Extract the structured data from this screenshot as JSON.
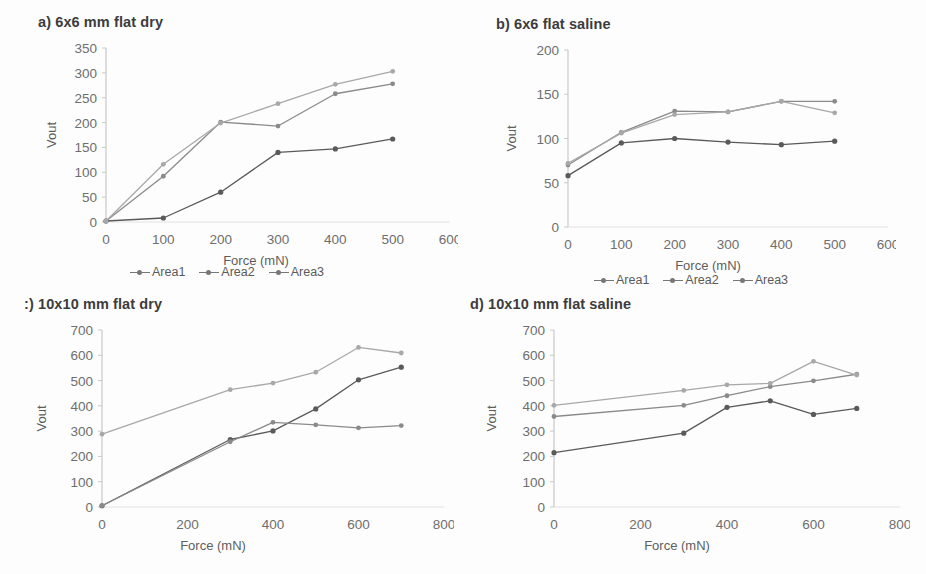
{
  "figure": {
    "background": "#fdfdfd",
    "series_colors": [
      "#5a5a5a",
      "#8a8a8a",
      "#a8a8a8"
    ],
    "legend_labels": [
      "Area1",
      "Area2",
      "Area3"
    ]
  },
  "panels": [
    {
      "id": "panel-a",
      "title": "a) 6x6 mm flat dry",
      "legend": [
        "Area1",
        "Area2",
        "Area3"
      ]
    },
    {
      "id": "panel-b",
      "title": "b) 6x6 flat saline",
      "legend": [
        "Area1",
        "Area2",
        "Area3"
      ]
    },
    {
      "id": "panel-c",
      "title": ":) 10x10 mm flat dry",
      "legend": []
    },
    {
      "id": "panel-d",
      "title": "d) 10x10 mm flat saline",
      "legend": []
    }
  ],
  "chart_data": [
    {
      "id": "a",
      "type": "line",
      "title": "a) 6x6 mm flat dry",
      "xlabel": "Force  (mN)",
      "ylabel": "Vout",
      "x": [
        0,
        100,
        200,
        300,
        400,
        500
      ],
      "xlim": [
        0,
        600
      ],
      "ylim": [
        0,
        350
      ],
      "xticks": [
        0,
        100,
        200,
        300,
        400,
        500,
        600
      ],
      "yticks": [
        0,
        50,
        100,
        150,
        200,
        250,
        300,
        350
      ],
      "grid": false,
      "legend_position": "bottom",
      "series": [
        {
          "name": "Area1",
          "values": [
            2,
            8,
            60,
            140,
            147,
            167
          ]
        },
        {
          "name": "Area2",
          "values": [
            2,
            92,
            201,
            193,
            258,
            278
          ]
        },
        {
          "name": "Area3",
          "values": [
            2,
            116,
            199,
            238,
            277,
            303
          ]
        }
      ]
    },
    {
      "id": "b",
      "type": "line",
      "title": "b) 6x6 flat saline",
      "xlabel": "Force (mN)",
      "ylabel": "Vout",
      "x": [
        0,
        100,
        200,
        300,
        400,
        500
      ],
      "xlim": [
        0,
        600
      ],
      "ylim": [
        0,
        200
      ],
      "xticks": [
        0,
        100,
        200,
        300,
        400,
        500,
        600
      ],
      "yticks": [
        0,
        50,
        100,
        150,
        200
      ],
      "grid": false,
      "legend_position": "bottom",
      "series": [
        {
          "name": "Area1",
          "values": [
            58,
            95,
            100,
            96,
            93,
            97
          ]
        },
        {
          "name": "Area2",
          "values": [
            70,
            107,
            131,
            130,
            142,
            142
          ]
        },
        {
          "name": "Area3",
          "values": [
            72,
            106,
            127,
            130,
            142,
            129
          ]
        }
      ]
    },
    {
      "id": "c",
      "type": "line",
      "title": ":) 10x10 mm flat dry",
      "xlabel": "Force  (mN)",
      "ylabel": "Vout",
      "x": [
        0,
        300,
        400,
        500,
        600,
        700
      ],
      "xlim": [
        0,
        800
      ],
      "ylim": [
        0,
        700
      ],
      "xticks": [
        0,
        200,
        400,
        600,
        800
      ],
      "yticks": [
        0,
        100,
        200,
        300,
        400,
        500,
        600,
        700
      ],
      "grid": false,
      "legend_position": "none",
      "series": [
        {
          "name": "Area1",
          "values": [
            5,
            267,
            301,
            388,
            503,
            553
          ]
        },
        {
          "name": "Area2",
          "values": [
            5,
            258,
            335,
            325,
            313,
            322
          ]
        },
        {
          "name": "Area3",
          "values": [
            288,
            464,
            490,
            533,
            631,
            609
          ]
        }
      ]
    },
    {
      "id": "d",
      "type": "line",
      "title": "d) 10x10 mm flat saline",
      "xlabel": "Force (mN)",
      "ylabel": "Vout",
      "x": [
        0,
        300,
        400,
        500,
        600,
        700
      ],
      "xlim": [
        0,
        800
      ],
      "ylim": [
        0,
        700
      ],
      "xticks": [
        0,
        200,
        400,
        600,
        800
      ],
      "yticks": [
        0,
        100,
        200,
        300,
        400,
        500,
        600,
        700
      ],
      "grid": false,
      "legend_position": "none",
      "series": [
        {
          "name": "Area1",
          "values": [
            215,
            292,
            394,
            420,
            366,
            390
          ]
        },
        {
          "name": "Area2",
          "values": [
            358,
            402,
            440,
            476,
            499,
            525
          ]
        },
        {
          "name": "Area3",
          "values": [
            402,
            461,
            483,
            489,
            576,
            522
          ]
        }
      ]
    }
  ]
}
